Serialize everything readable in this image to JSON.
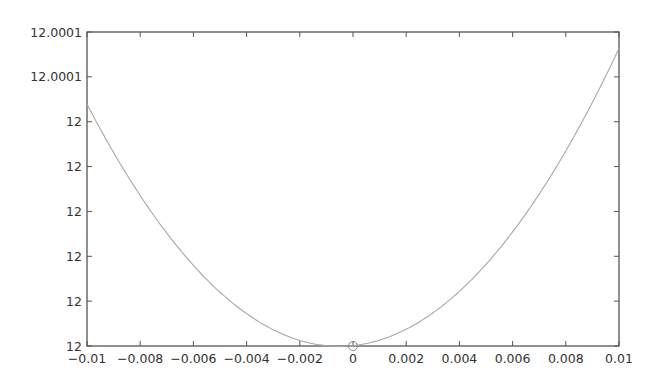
{
  "chart_data": {
    "type": "line",
    "title": "",
    "xlabel": "",
    "ylabel": "",
    "xlim": [
      -0.01,
      0.01
    ],
    "ylim": [
      12.0,
      12.00014
    ],
    "grid": false,
    "legend": null,
    "x_ticks": [
      -0.01,
      -0.008,
      -0.006,
      -0.004,
      -0.002,
      0,
      0.002,
      0.004,
      0.006,
      0.008,
      0.01
    ],
    "x_tick_labels": [
      "−0.01",
      "−0.008",
      "−0.006",
      "−0.004",
      "−0.002",
      "0",
      "0.002",
      "0.004",
      "0.006",
      "0.008",
      "0.01"
    ],
    "y_ticks": [
      12.0,
      12.00002,
      12.00004,
      12.00006,
      12.00008,
      12.0001,
      12.00012,
      12.00014
    ],
    "y_tick_labels": [
      "12",
      "12",
      "12",
      "12",
      "12",
      "12",
      "12.0001",
      "12.0001"
    ],
    "series": [
      {
        "name": "curve",
        "color": "#a8a8a8",
        "x": [
          -0.01,
          -0.009,
          -0.008,
          -0.007,
          -0.006,
          -0.005,
          -0.004,
          -0.003,
          -0.002,
          -0.001,
          0,
          0.001,
          0.002,
          0.003,
          0.004,
          0.005,
          0.006,
          0.007,
          0.008,
          0.009,
          0.01
        ],
        "y": [
          12.000107,
          12.0000866,
          12.0000665,
          12.0000511,
          12.0000372,
          12.0000237,
          12.0000145,
          12.0000071,
          12.0000019,
          12.0000003,
          12.0,
          12.0000024,
          12.0000073,
          12.000015,
          12.0000246,
          12.0000365,
          12.0000507,
          12.0000677,
          12.000086,
          12.0001092,
          12.000133
        ]
      }
    ],
    "markers": [
      {
        "name": "minimum",
        "x": 0,
        "y": 12.0,
        "shape": "circle",
        "color": "#888888"
      }
    ],
    "frame_color": "#555555"
  }
}
